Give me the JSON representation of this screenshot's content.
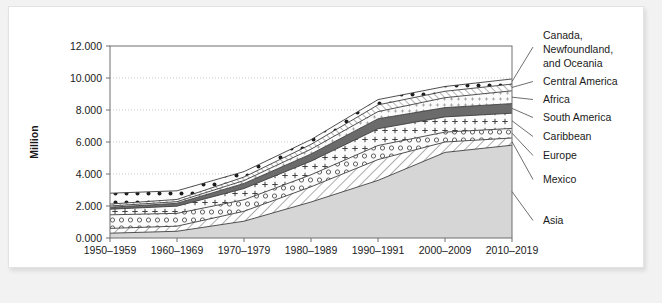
{
  "figure": {
    "background_color": "#f2f2f2",
    "card_color": "#ffffff"
  },
  "axis": {
    "y_title": "Million",
    "y_ticks": [
      "0.000",
      "2.000",
      "4.000",
      "6.000",
      "8.000",
      "10.000",
      "12.000"
    ],
    "x_ticks": [
      "1950–1959",
      "1960–1969",
      "1970–1979",
      "1980–1989",
      "1990–1991",
      "2000–2009",
      "2010–2019"
    ]
  },
  "legend": {
    "items": [
      {
        "label_lines": [
          "Canada,",
          "Newfoundland,",
          "and Oceania"
        ],
        "key": "canada-newfoundland-oceania"
      },
      {
        "label_lines": [
          "Central America"
        ],
        "key": "central-america"
      },
      {
        "label_lines": [
          "Africa"
        ],
        "key": "africa"
      },
      {
        "label_lines": [
          "South America"
        ],
        "key": "south-america"
      },
      {
        "label_lines": [
          "Caribbean"
        ],
        "key": "caribbean"
      },
      {
        "label_lines": [
          "Europe"
        ],
        "key": "europe"
      },
      {
        "label_lines": [
          "Mexico"
        ],
        "key": "mexico"
      },
      {
        "label_lines": [
          "Asia"
        ],
        "key": "asia"
      }
    ]
  },
  "chart_data": {
    "type": "area",
    "title": "",
    "xlabel": "",
    "ylabel": "Million",
    "ylim": [
      0,
      12
    ],
    "grid": true,
    "legend_position": "right-callout",
    "stacked": true,
    "stack_order_bottom_to_top": [
      "Asia",
      "Mexico",
      "Europe",
      "Caribbean",
      "South America",
      "Africa",
      "Central America",
      "Canada, Newfoundland, and Oceania"
    ],
    "categories": [
      "1950–1959",
      "1960–1969",
      "1970–1979",
      "1980–1989",
      "1990–1991",
      "2000–2009",
      "2010–2019"
    ],
    "series": [
      {
        "name": "Asia",
        "values": [
          0.3,
          0.42,
          1.05,
          2.25,
          3.6,
          5.35,
          5.8
        ]
      },
      {
        "name": "Mexico",
        "values": [
          0.3,
          0.32,
          0.62,
          0.95,
          1.3,
          0.65,
          0.45
        ]
      },
      {
        "name": "Europe",
        "values": [
          0.85,
          0.8,
          0.72,
          0.75,
          0.88,
          0.62,
          0.6
        ]
      },
      {
        "name": "Caribbean",
        "values": [
          0.35,
          0.45,
          0.7,
          0.85,
          1.05,
          0.95,
          0.95
        ]
      },
      {
        "name": "South America",
        "values": [
          0.12,
          0.18,
          0.32,
          0.45,
          0.62,
          0.58,
          0.6
        ]
      },
      {
        "name": "Africa",
        "values": [
          0.08,
          0.1,
          0.18,
          0.3,
          0.45,
          0.62,
          0.8
        ]
      },
      {
        "name": "Central America",
        "values": [
          0.12,
          0.14,
          0.22,
          0.3,
          0.42,
          0.4,
          0.42
        ]
      },
      {
        "name": "Canada, Newfoundland, and Oceania",
        "values": [
          0.68,
          0.54,
          0.34,
          0.3,
          0.33,
          0.3,
          0.32
        ]
      }
    ],
    "totals": [
      2.8,
      2.95,
      4.15,
      6.15,
      8.65,
      9.47,
      9.94
    ]
  }
}
